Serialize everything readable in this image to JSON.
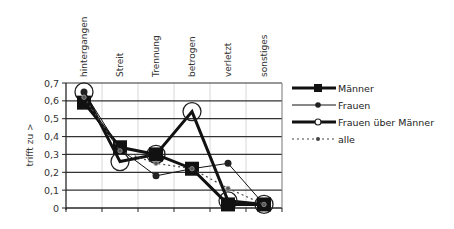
{
  "chart_data": {
    "type": "line",
    "title": "",
    "xlabel": "",
    "ylabel": "trifft zu >",
    "ylim": [
      0,
      0.7
    ],
    "yticks": [
      "0",
      "0,1",
      "0,2",
      "0,3",
      "0,4",
      "0,5",
      "0,6",
      "0,7"
    ],
    "grid": true,
    "legend_position": "right",
    "categories": [
      "hintergangen",
      "Streit",
      "Trennung",
      "betrogen",
      "verletzt",
      "sonstiges"
    ],
    "series": [
      {
        "name": "Männer",
        "values": [
          0.59,
          0.34,
          0.3,
          0.22,
          0.02,
          0.02
        ],
        "color": "#111111",
        "style": "solid-thick",
        "marker": "square"
      },
      {
        "name": "Frauen",
        "values": [
          0.65,
          0.33,
          0.18,
          0.22,
          0.25,
          0.02
        ],
        "color": "#111111",
        "style": "solid-thin",
        "marker": "dot"
      },
      {
        "name": "Frauen über Männer",
        "values": [
          0.65,
          0.26,
          0.3,
          0.54,
          0.04,
          0.02
        ],
        "color": "#111111",
        "style": "solid-thick",
        "marker": "open-circle"
      },
      {
        "name": "alle",
        "values": [
          0.62,
          0.32,
          0.25,
          0.22,
          0.11,
          0.02
        ],
        "color": "#444444",
        "style": "dotted",
        "marker": "small-diamond"
      }
    ]
  }
}
